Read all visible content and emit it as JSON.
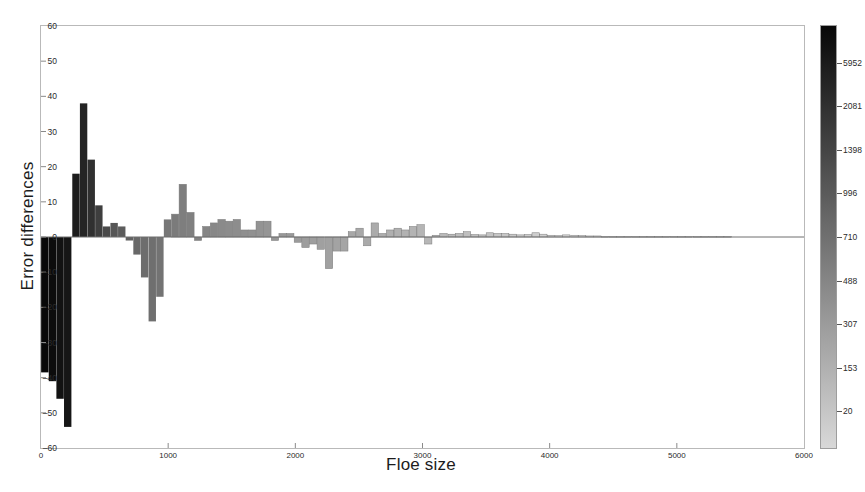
{
  "figure": {
    "title": "",
    "background": "#ffffff"
  },
  "axes": {
    "ylabel": "Error differences",
    "xlabel": "Floe size",
    "yticks": [
      "60",
      "50",
      "40",
      "30",
      "20",
      "10",
      "0",
      "-10",
      "-20",
      "-30",
      "-40",
      "-50",
      "-60"
    ],
    "xticks": [
      "0",
      "1000",
      "2000",
      "3000",
      "4000",
      "5000",
      "6000"
    ]
  },
  "colorbar": {
    "label": "",
    "ticks": [
      "5952",
      "2081",
      "1398",
      "996",
      "710",
      "488",
      "307",
      "153",
      "20"
    ],
    "tick_values": [
      5952,
      2081,
      1398,
      996,
      710,
      488,
      307,
      153,
      20
    ],
    "low_color": "#000000",
    "high_color": "#d8d8d8"
  },
  "chart_data": {
    "type": "bar",
    "title": "",
    "xlabel": "Floe size",
    "ylabel": "Error differences",
    "xlim": [
      0,
      6000
    ],
    "ylim": [
      -60,
      60
    ],
    "grid": false,
    "legend": null,
    "colormap": "gray (dark = small count, light = large count)",
    "color_axis_label": "",
    "color_axis_ticks": [
      20,
      153,
      307,
      488,
      710,
      996,
      1398,
      2081,
      5952
    ],
    "bar_width": 58,
    "x": [
      30,
      90,
      150,
      210,
      275,
      335,
      395,
      455,
      515,
      575,
      635,
      695,
      755,
      815,
      875,
      935,
      995,
      1055,
      1115,
      1175,
      1235,
      1300,
      1360,
      1420,
      1480,
      1540,
      1600,
      1660,
      1720,
      1780,
      1840,
      1900,
      1960,
      2020,
      2080,
      2140,
      2200,
      2265,
      2325,
      2385,
      2445,
      2505,
      2565,
      2625,
      2685,
      2745,
      2805,
      2865,
      2925,
      2985,
      3045,
      3105,
      3165,
      3230,
      3290,
      3350,
      3410,
      3470,
      3530,
      3590,
      3650,
      3710,
      3770,
      3830,
      3890,
      3950,
      4010,
      4070,
      4130,
      4195,
      4255,
      4315,
      4375,
      4435,
      4495,
      4555,
      4615,
      4675,
      4735,
      4795,
      4855,
      4915,
      4975,
      5035,
      5095,
      5160,
      5220,
      5280,
      5340,
      5400
    ],
    "values": [
      -38.5,
      -41,
      -46,
      -54,
      18,
      38,
      22,
      9,
      3,
      4,
      3,
      -1,
      -5,
      -11.5,
      -24,
      -17,
      5,
      6.5,
      15,
      7,
      -1,
      3,
      4,
      5,
      4.5,
      5,
      2,
      2,
      4.5,
      4.5,
      -1,
      1,
      1,
      -1.5,
      -3,
      -2,
      -3.5,
      -9,
      -4,
      -4,
      1.5,
      2.5,
      -2.5,
      4,
      1,
      2,
      2.5,
      2,
      3,
      3.5,
      -2,
      0.5,
      1,
      0.8,
      1,
      1.5,
      0.7,
      0.6,
      1.2,
      1,
      1,
      0.8,
      0.6,
      0.7,
      1.2,
      0.8,
      0.5,
      0.4,
      0.6,
      0.5,
      0.4,
      0.3,
      0.3,
      0.2,
      0.2,
      0.2,
      0.2,
      0.2,
      0.2,
      0.2,
      0.2,
      0.2,
      0.2,
      0.2,
      0.2,
      0.2,
      0.2,
      0.2,
      0.2,
      0.2
    ],
    "counts": [
      20,
      22,
      25,
      28,
      33,
      40,
      55,
      80,
      110,
      153,
      180,
      210,
      250,
      290,
      307,
      340,
      380,
      420,
      460,
      488,
      520,
      560,
      600,
      640,
      680,
      710,
      750,
      790,
      830,
      870,
      910,
      950,
      996,
      1040,
      1090,
      1140,
      1190,
      1250,
      1300,
      1398,
      1450,
      1520,
      1590,
      1660,
      1740,
      1820,
      1900,
      1990,
      2081,
      2180,
      2280,
      2390,
      2500,
      2620,
      2750,
      2880,
      3020,
      3170,
      3330,
      3500,
      3670,
      3850,
      4040,
      4240,
      4450,
      4670,
      4900,
      5140,
      5390,
      5650,
      5920,
      5952,
      5952,
      5952,
      5952,
      5952,
      5952,
      5952,
      5952,
      5952,
      5952,
      5952,
      5952,
      5952,
      5952,
      5952,
      5952,
      5952,
      5952,
      5952,
      5952
    ]
  }
}
